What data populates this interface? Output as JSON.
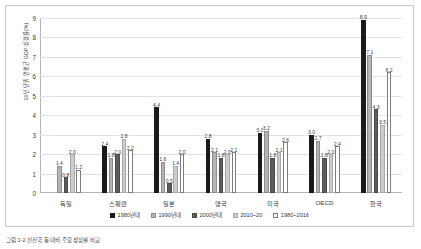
{
  "figure": {
    "y_axis_title": "10년 단위 연평균 GDP 성장률(%)",
    "caption": "그림 1-2  선진국 등 대비 주요 성장률 비교"
  },
  "chart_data": {
    "type": "bar",
    "title": "",
    "xlabel": "",
    "ylabel": "10년 단위 연평균 GDP 성장률(%)",
    "ylim": [
      0,
      9
    ],
    "yticks": [
      "0",
      "1",
      "2",
      "3",
      "4",
      "5",
      "6",
      "7",
      "8",
      "9"
    ],
    "grid": true,
    "legend_position": "bottom",
    "categories": [
      "독일",
      "스웨덴",
      "일본",
      "영국",
      "미국",
      "OECD",
      "한국"
    ],
    "series": [
      {
        "name": "1980년대",
        "color": "#1a1a1a",
        "border": "#1a1a1a",
        "values": [
          null,
          2.4,
          4.4,
          2.8,
          3.1,
          3.0,
          8.9
        ],
        "labels": [
          "",
          "2.4",
          "4.4",
          "2.8",
          "3.1",
          "3.0",
          "8.9"
        ]
      },
      {
        "name": "1990년대",
        "color": "#b4b4b4",
        "border": "#8c8c8c",
        "values": [
          1.4,
          1.8,
          1.6,
          2.1,
          3.2,
          2.7,
          7.1
        ],
        "labels": [
          "1.4",
          "1.8",
          "1.6",
          "2.1",
          "3.2",
          "2.7",
          "7.1"
        ]
      },
      {
        "name": "2000년대",
        "color": "#5c5c5c",
        "border": "#4a4a4a",
        "values": [
          0.8,
          2.0,
          0.5,
          1.8,
          1.8,
          1.8,
          4.3
        ],
        "labels": [
          "0.8",
          "2.0",
          "0.5",
          "1.8",
          "1.8",
          "1.8",
          "4.3"
        ]
      },
      {
        "name": "2010~20",
        "color": "#cccccc",
        "border": "#a8a8a8",
        "values": [
          2.0,
          2.8,
          1.4,
          2.0,
          2.1,
          2.0,
          3.5
        ],
        "labels": [
          "2.0",
          "2.8",
          "1.4",
          "2.0",
          "2.1",
          "2.0",
          "3.5"
        ]
      },
      {
        "name": "1980~2016",
        "color": "#ffffff",
        "border": "#7d7d7d",
        "values": [
          1.2,
          2.2,
          2.0,
          2.1,
          2.6,
          2.4,
          6.2
        ],
        "labels": [
          "1.2",
          "2.2",
          "2.0",
          "2.1",
          "2.6",
          "2.4",
          "6.2"
        ]
      }
    ]
  }
}
